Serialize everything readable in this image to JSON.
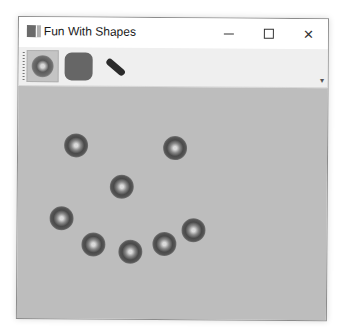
{
  "window": {
    "title": "Fun With Shapes",
    "controls": {
      "minimize": "minimize",
      "maximize": "maximize",
      "close": "✕"
    }
  },
  "toolbar": {
    "tools": [
      {
        "name": "circle-tool",
        "icon": "radial-circle-icon",
        "selected": true
      },
      {
        "name": "rectangle-tool",
        "icon": "rounded-rectangle-icon",
        "selected": false
      },
      {
        "name": "line-tool",
        "icon": "line-icon",
        "selected": false
      }
    ],
    "overflow_glyph": "▾"
  },
  "canvas": {
    "background": "#bdbdbd",
    "shapes": [
      {
        "type": "circle",
        "x": 46,
        "y": 47
      },
      {
        "type": "circle",
        "x": 145,
        "y": 49
      },
      {
        "type": "circle",
        "x": 92,
        "y": 88
      },
      {
        "type": "circle",
        "x": 32,
        "y": 120
      },
      {
        "type": "circle",
        "x": 64,
        "y": 146
      },
      {
        "type": "circle",
        "x": 101,
        "y": 153
      },
      {
        "type": "circle",
        "x": 135,
        "y": 145
      },
      {
        "type": "circle",
        "x": 164,
        "y": 131
      }
    ]
  }
}
